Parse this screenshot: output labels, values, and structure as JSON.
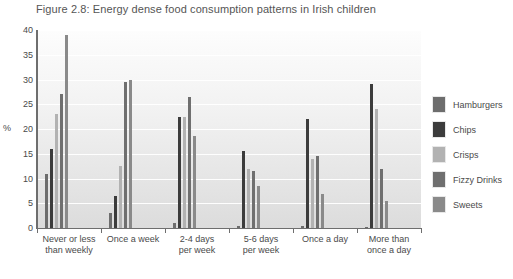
{
  "figure": {
    "title": "Figure 2.8: Energy dense food consumption patterns in Irish children"
  },
  "axis": {
    "unit_label": "%",
    "y_ticks": [
      "0",
      "5",
      "10",
      "15",
      "20",
      "25",
      "30",
      "35",
      "40"
    ]
  },
  "legend": {
    "items": [
      {
        "label": "Hamburgers",
        "color": "#6d6d6d"
      },
      {
        "label": "Chips",
        "color": "#3c3c3c"
      },
      {
        "label": "Crisps",
        "color": "#b2b2b2"
      },
      {
        "label": "Fizzy Drinks",
        "color": "#6f6f6f"
      },
      {
        "label": "Sweets",
        "color": "#8a8a8a"
      }
    ]
  },
  "chart_data": {
    "type": "bar",
    "title": "Figure 2.8: Energy dense food consumption patterns in Irish children",
    "xlabel": "",
    "ylabel": "%",
    "ylim": [
      0,
      40
    ],
    "ytick_step": 5,
    "grid": true,
    "legend_position": "right",
    "categories": [
      "Never or less\nthan weekly",
      "Once a week",
      "2-4 days\nper week",
      "5-6 days\nper week",
      "Once a day",
      "More than\nonce a day"
    ],
    "series": [
      {
        "name": "Hamburgers",
        "color": "#6d6d6d",
        "values": [
          11.0,
          3.0,
          1.0,
          0.5,
          0.4,
          0.3
        ]
      },
      {
        "name": "Chips",
        "color": "#3c3c3c",
        "values": [
          16.0,
          6.5,
          22.5,
          15.5,
          22.0,
          29.0
        ]
      },
      {
        "name": "Crisps",
        "color": "#b2b2b2",
        "values": [
          23.0,
          12.5,
          22.5,
          12.0,
          14.0,
          24.0
        ]
      },
      {
        "name": "Fizzy Drinks",
        "color": "#6f6f6f",
        "values": [
          27.0,
          29.5,
          26.5,
          11.5,
          14.5,
          12.0
        ]
      },
      {
        "name": "Sweets",
        "color": "#8a8a8a",
        "values": [
          39.0,
          30.0,
          18.5,
          8.5,
          6.8,
          5.5
        ]
      }
    ]
  }
}
